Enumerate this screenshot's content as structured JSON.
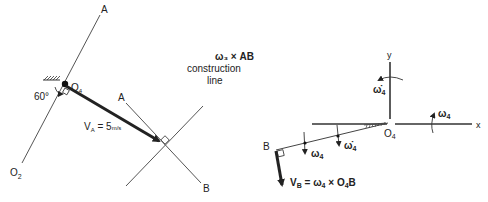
{
  "left_diagram": {
    "line_a_top_label": "A",
    "line_o2_label": "O",
    "line_o2_sub": "2",
    "pivot_label": "O",
    "pivot_sub": "4",
    "angle_label": "60°",
    "velocity_label_main": "V",
    "velocity_label_sub": "A",
    "velocity_label_value": " = 5",
    "velocity_label_unit": "m/s",
    "cross_a_label": "A",
    "cross_b_label": "B",
    "construction_title": "ω₃ × AB",
    "construction_line1": "construction",
    "construction_line2": "line"
  },
  "right_diagram": {
    "y_axis_label": "y",
    "x_axis_label": "x",
    "origin_label": "O",
    "origin_sub": "4",
    "alpha_top_label": "ω̇",
    "alpha_top_sub": "4",
    "omega_right_label": "ω",
    "omega_right_sub": "4",
    "point_b_label": "B",
    "omega_marker_label": "ω",
    "omega_marker_sub": "4",
    "alpha_marker_label": "ω̇",
    "alpha_marker_sub": "4",
    "vb_label_main": "V",
    "vb_label_sub": "B",
    "vb_eq": " = ω",
    "vb_eq_sub": "4",
    "vb_cross": " × O",
    "vb_cross_sub": "4",
    "vb_tail": "B"
  }
}
